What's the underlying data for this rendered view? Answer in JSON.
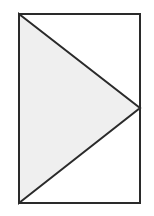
{
  "figure": {
    "type": "geometric-diagram",
    "canvas": {
      "width": 154,
      "height": 216,
      "background_color": "#ffffff"
    },
    "colors": {
      "stroke": "#2a2a2a",
      "triangle_fill": "#efefef",
      "rectangle_fill": "#ffffff",
      "page_background": "#ffffff"
    },
    "stroke_width": 2,
    "shapes": [
      {
        "name": "rectangle",
        "kind": "rect",
        "x": 19,
        "y": 14,
        "width": 121,
        "height": 189,
        "fill": "#ffffff",
        "stroke": "#2a2a2a",
        "stroke_width": 2,
        "vertices": [
          [
            19,
            14
          ],
          [
            140,
            14
          ],
          [
            140,
            203
          ],
          [
            19,
            203
          ]
        ]
      },
      {
        "name": "triangle",
        "kind": "polygon",
        "fill": "#efefef",
        "stroke": "#2a2a2a",
        "stroke_width": 2,
        "points": "19,14 140,108 19,203",
        "vertices": [
          [
            19,
            14
          ],
          [
            140,
            108
          ],
          [
            19,
            203
          ]
        ],
        "description": "Isosceles triangle with vertical base on the left edge of the rectangle and apex on the right edge"
      }
    ],
    "labels": []
  }
}
